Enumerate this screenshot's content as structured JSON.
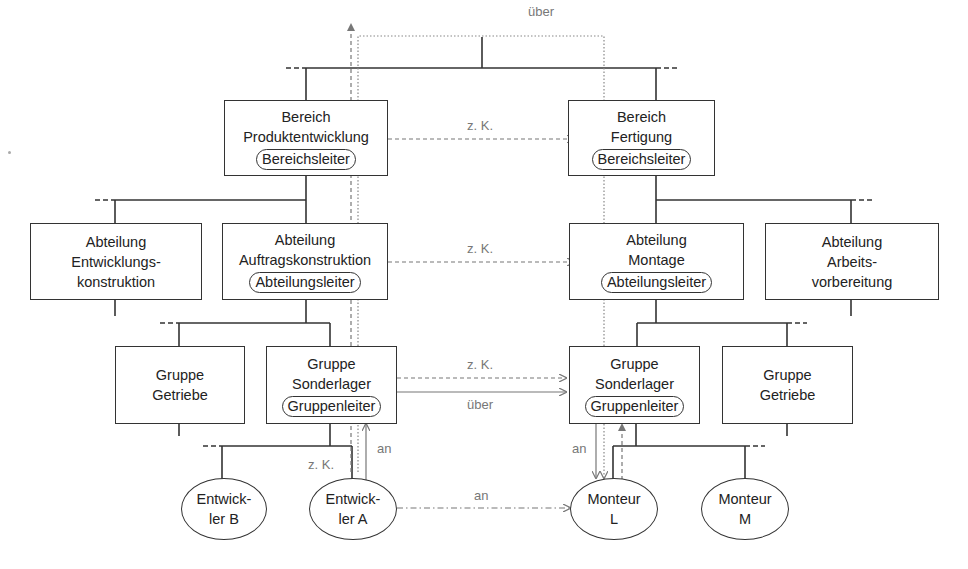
{
  "diagram": {
    "type": "organizational chart with communication paths",
    "top_connector_label": "über",
    "bereiche": [
      {
        "id": "produktentwicklung",
        "line1": "Bereich",
        "line2": "Produktentwicklung",
        "role": "Bereichsleiter"
      },
      {
        "id": "fertigung",
        "line1": "Bereich",
        "line2": "Fertigung",
        "role": "Bereichsleiter"
      }
    ],
    "abteilungen": [
      {
        "id": "entwicklungskonstruktion",
        "line1": "Abteilung",
        "line2": "Entwicklungs-",
        "line3": "konstruktion"
      },
      {
        "id": "auftragskonstruktion",
        "line1": "Abteilung",
        "line2": "Auftragskonstruktion",
        "role": "Abteilungsleiter"
      },
      {
        "id": "montage",
        "line1": "Abteilung",
        "line2": "Montage",
        "role": "Abteilungsleiter"
      },
      {
        "id": "arbeitsvorbereitung",
        "line1": "Abteilung",
        "line2": "Arbeits-",
        "line3": "vorbereitung"
      }
    ],
    "gruppen": [
      {
        "id": "getriebe-left",
        "line1": "Gruppe",
        "line2": "Getriebe"
      },
      {
        "id": "sonderlager-left",
        "line1": "Gruppe",
        "line2": "Sonderlager",
        "role": "Gruppenleiter"
      },
      {
        "id": "sonderlager-right",
        "line1": "Gruppe",
        "line2": "Sonderlager",
        "role": "Gruppenleiter"
      },
      {
        "id": "getriebe-right",
        "line1": "Gruppe",
        "line2": "Getriebe"
      }
    ],
    "personen": [
      {
        "id": "entwickler-b",
        "line1": "Entwick-",
        "line2": "ler B"
      },
      {
        "id": "entwickler-a",
        "line1": "Entwick-",
        "line2": "ler A"
      },
      {
        "id": "monteur-l",
        "line1": "Monteur",
        "line2": "L"
      },
      {
        "id": "monteur-m",
        "line1": "Monteur",
        "line2": "M"
      }
    ],
    "edge_labels": {
      "bereich_zk": "z. K.",
      "abteilung_zk": "z. K.",
      "gruppe_zk": "z. K.",
      "gruppe_ueber": "über",
      "entwickler_zk": "z. K.",
      "entwickler_an": "an",
      "monteur_an_vertical": "an",
      "person_an_horizontal": "an"
    }
  }
}
